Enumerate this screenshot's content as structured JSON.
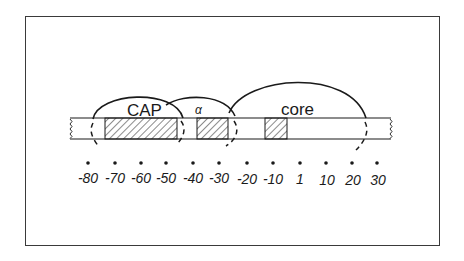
{
  "diagram": {
    "type": "promoter-map",
    "regions": [
      {
        "name": "CAP",
        "label": "CAP",
        "hatch_start": -70,
        "hatch_end": -45
      },
      {
        "name": "alpha",
        "label": "α",
        "hatch_start": -37,
        "hatch_end": -27
      },
      {
        "name": "core",
        "label": "core",
        "hatch_start": -13,
        "hatch_end": -6
      }
    ],
    "axis": {
      "ticks": [
        "-80",
        "-70",
        "-60",
        "-50",
        "-40",
        "-30",
        "-20",
        "-10",
        "1",
        "10",
        "20",
        "30"
      ]
    },
    "colors": {
      "ink": "#1a1a1a",
      "frame": "#3a3a3a",
      "background": "#ffffff"
    }
  }
}
